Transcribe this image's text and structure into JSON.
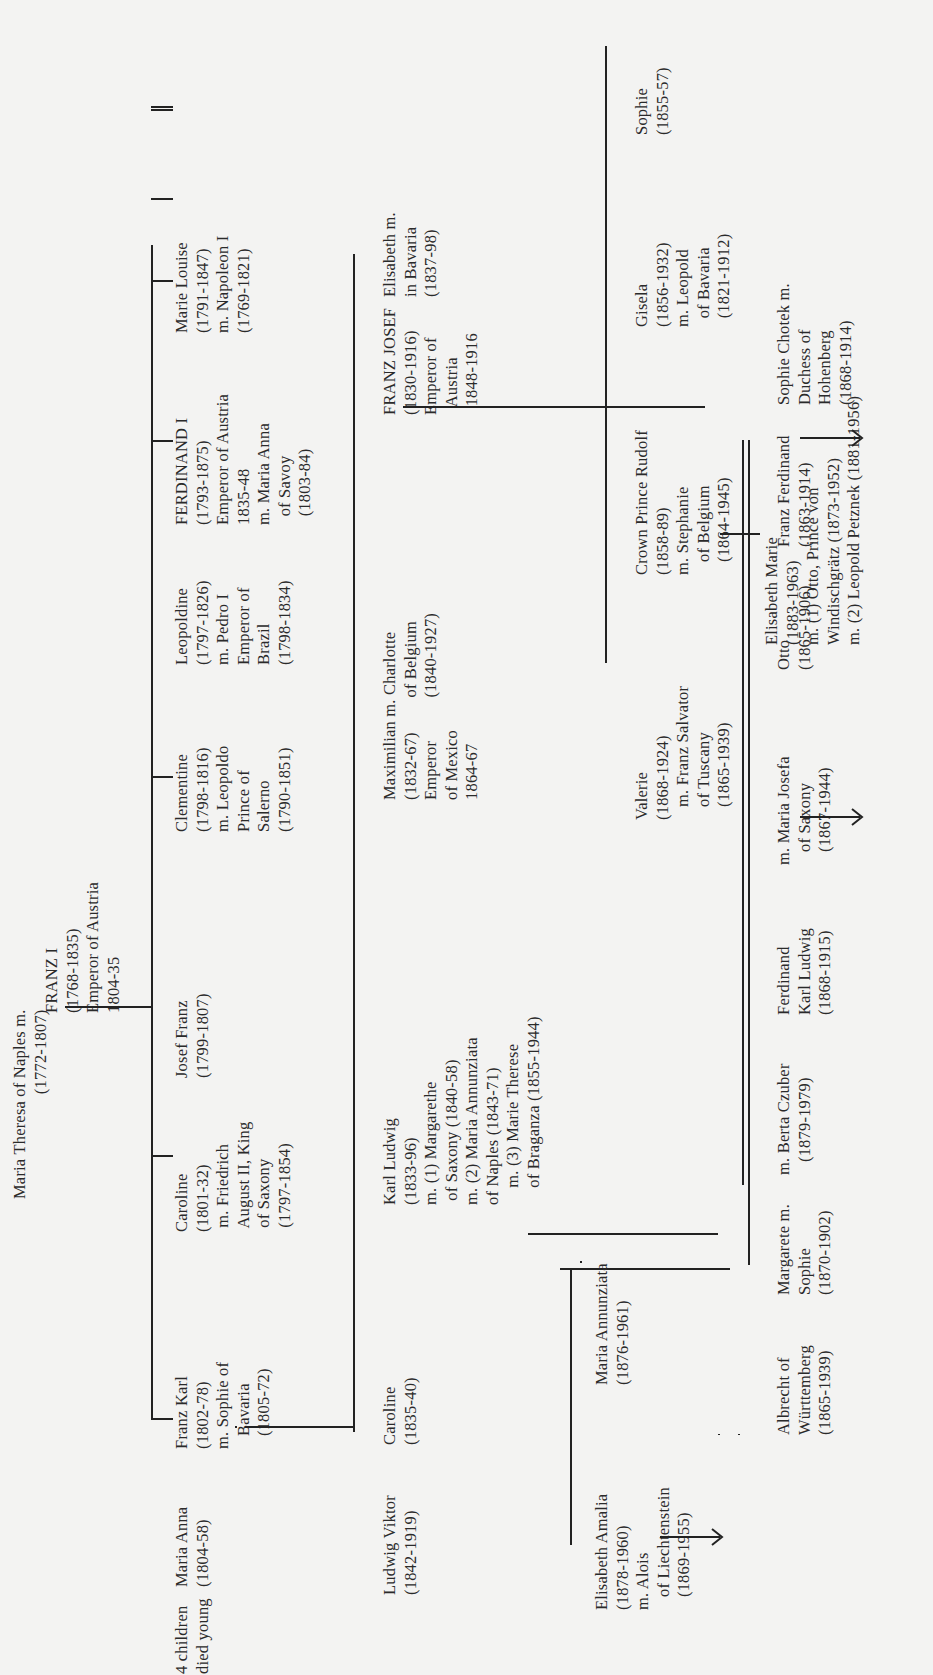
{
  "diagram": {
    "type": "family_tree",
    "orientation": "rotated-90-ccw",
    "root": {
      "left": "Maria Theresa of Naples m.\n(1772-1807)",
      "right": "FRANZ I\n(1768-1835)\nEmperor of Austria\n1804-35"
    },
    "generation1": [
      {
        "id": "marie-louise",
        "text": "Marie Louise\n(1791-1847)\nm. Napoleon I\n(1769-1821)"
      },
      {
        "id": "ferdinand-i",
        "text": "FERDINAND I\n(1793-1875)\nEmperor of Austria\n1835-48\nm. Maria Anna\n  of Savoy\n  (1803-84)"
      },
      {
        "id": "leopoldine",
        "text": "Leopoldine\n(1797-1826)\nm. Pedro I\nEmperor of\nBrazil\n(1798-1834)"
      },
      {
        "id": "clementine",
        "text": "Clementine\n(1798-1816)\nm. Leopoldo\nPrince of\nSalerno\n(1790-1851)"
      },
      {
        "id": "josef-franz",
        "text": "Josef Franz\n(1799-1807)"
      },
      {
        "id": "caroline-1801",
        "text": "Caroline\n(1801-32)\n m. Friedrich\n August II, King\n of Saxony\n (1797-1854)"
      },
      {
        "id": "franz-karl",
        "text": "Franz Karl\n(1802-78)\nm. Sophie of\n   Bavaria\n   (1805-72)"
      },
      {
        "id": "maria-anna",
        "text": "Maria Anna\n(1804-58)"
      },
      {
        "id": "four-children",
        "text": "4 children\ndied young"
      }
    ],
    "generation2": [
      {
        "id": "franz-josef",
        "text": "FRANZ JOSEF\n(1830-1916)\nEmperor of\n  Austria\n  1848-1916"
      },
      {
        "id": "elisabeth",
        "text": "Elisabeth m.\nin Bavaria\n(1837-98)"
      },
      {
        "id": "maximilian",
        "text": "Maximilian m. Charlotte\n(1832-67)        of Belgium\nEmperor          (1840-1927)\nof Mexico\n1864-67"
      },
      {
        "id": "karl-ludwig",
        "text": "Karl Ludwig\n(1833-96)\nm. (1) Margarethe\n of Saxony (1840-58)\nm. (2) Maria Annunziata\nof Naples (1843-71)\n    m. (3) Marie Therese\n    of Braganza (1855-1944)"
      },
      {
        "id": "caroline-1835",
        "text": "Caroline\n(1835-40)"
      },
      {
        "id": "ludwig-viktor",
        "text": "Ludwig Viktor\n(1842-1919)"
      }
    ],
    "generation3_franz_josef": [
      {
        "id": "sophie",
        "text": "Sophie\n(1855-57)"
      },
      {
        "id": "gisela",
        "text": "Gisela\n(1856-1932)\nm. Leopold\n  of Bavaria\n  (1821-1912)"
      },
      {
        "id": "rudolf",
        "text": "Crown Prince Rudolf\n(1858-89)\nm. Stephanie\n   of Belgium\n   (1864-1945)"
      },
      {
        "id": "valerie",
        "text": "Valerie\n(1868-1924)\n   m. Franz Salvator\n   of Tuscany\n   (1865-1939)"
      }
    ],
    "generation4_rudolf": [
      {
        "id": "elisabeth-marie",
        "text": "Elisabeth Marie\n(1883-1963)\nm. (1) Otto, Prince von\nWindischgrätz (1873-1952)\nm. (2) Leopold Petznek (1881-1956)"
      }
    ],
    "generation3_karl_ludwig": [
      {
        "id": "franz-ferdinand",
        "text": "Franz Ferdinand\n(1863-1914)"
      },
      {
        "id": "sophie-chotek",
        "text": "Sophie Chotek m.\nDuchess of\nHohenberg\n(1868-1914)"
      },
      {
        "id": "otto",
        "text": "Otto\n(1865-1906)"
      },
      {
        "id": "maria-josefa",
        "text": "m. Maria Josefa\n   of Saxony\n   (1867-1944)"
      },
      {
        "id": "ferdinand-karl",
        "text": "Ferdinand\nKarl Ludwig\n(1868-1915)"
      },
      {
        "id": "berta-czuber",
        "text": "m. Berta Czuber\n   (1879-1979)"
      },
      {
        "id": "margarete-sophie",
        "text": "Margarete m.\nSophie\n(1870-1902)"
      },
      {
        "id": "albrecht",
        "text": "Albrecht of\nWürttemberg\n(1865-1939)"
      },
      {
        "id": "maria-annunziata",
        "text": "Maria Annunziata\n(1876-1961)"
      },
      {
        "id": "elisabeth-amalia",
        "text": "Elisabeth Amalia\n(1878-1960)\nm. Alois\n   of Liechtenstein\n   (1869-1955)"
      }
    ],
    "colors": {
      "ink": "#2a2a2a",
      "paper": "#f3f3f2"
    }
  }
}
